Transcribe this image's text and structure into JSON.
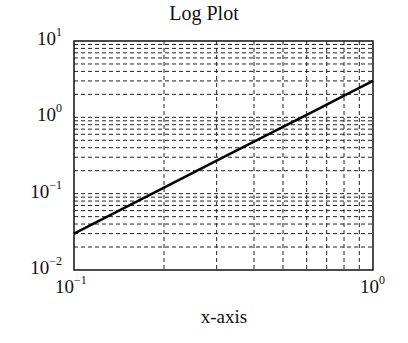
{
  "chart_data": {
    "type": "line",
    "title": "Log Plot",
    "xlabel": "x-axis",
    "ylabel": "",
    "xscale": "log",
    "yscale": "log",
    "xlim": [
      0.1,
      1
    ],
    "ylim": [
      0.01,
      10
    ],
    "grid": true,
    "grid_style": "dashed, major and minor",
    "x_ticks": [
      {
        "base": "10",
        "exp": "−1"
      },
      {
        "base": "10",
        "exp": "0"
      }
    ],
    "y_ticks": [
      {
        "base": "10",
        "exp": "1"
      },
      {
        "base": "10",
        "exp": "0"
      },
      {
        "base": "10",
        "exp": "−1"
      },
      {
        "base": "10",
        "exp": "−2"
      }
    ],
    "series": [
      {
        "name": "y = 3x^2",
        "x": [
          0.1,
          0.2,
          0.3,
          0.4,
          0.5,
          0.6,
          0.7,
          0.8,
          0.9,
          1.0
        ],
        "y": [
          0.03,
          0.12,
          0.27,
          0.48,
          0.75,
          1.08,
          1.47,
          1.92,
          2.43,
          3.0
        ],
        "color": "#000000"
      }
    ],
    "legend": null
  }
}
